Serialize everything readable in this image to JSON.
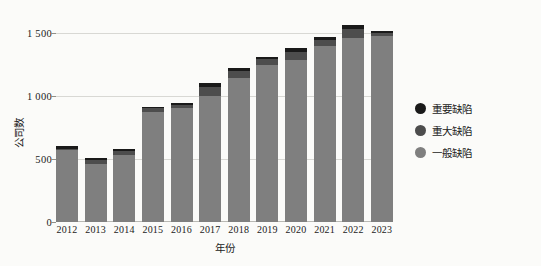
{
  "chart_data": {
    "type": "bar",
    "subtype": "stacked-bar",
    "title": "",
    "xlabel": "年份",
    "ylabel": "公司数",
    "categories": [
      "2012",
      "2013",
      "2014",
      "2015",
      "2016",
      "2017",
      "2018",
      "2019",
      "2020",
      "2021",
      "2022",
      "2023"
    ],
    "series": [
      {
        "name": "一般缺陷",
        "color": "#7f7f7f",
        "values": [
          570,
          460,
          530,
          875,
          900,
          1000,
          1140,
          1240,
          1280,
          1395,
          1455,
          1470
        ]
      },
      {
        "name": "重大缺陷",
        "color": "#4d4d4d",
        "values": [
          10,
          30,
          35,
          25,
          30,
          70,
          55,
          50,
          70,
          50,
          75,
          25
        ]
      },
      {
        "name": "重要缺陷",
        "color": "#1a1a1a",
        "values": [
          20,
          20,
          15,
          10,
          15,
          35,
          25,
          20,
          25,
          20,
          30,
          15
        ]
      }
    ],
    "totals": [
      600,
      510,
      580,
      910,
      945,
      1105,
      1220,
      1310,
      1375,
      1465,
      1560,
      1510
    ],
    "yticks": [
      0,
      500,
      1000,
      1500
    ],
    "ytick_labels": [
      "0",
      "500",
      "1 000",
      "1 500"
    ],
    "ylim": [
      0,
      1600
    ],
    "grid": "horizontal",
    "legend_position": "right"
  },
  "axes": {
    "y_title": "公司数",
    "x_title": "年份"
  },
  "legend": {
    "items": [
      {
        "label": "重要缺陷",
        "color": "#1a1a1a"
      },
      {
        "label": "重大缺陷",
        "color": "#4d4d4d"
      },
      {
        "label": "一般缺陷",
        "color": "#7f7f7f"
      }
    ]
  }
}
